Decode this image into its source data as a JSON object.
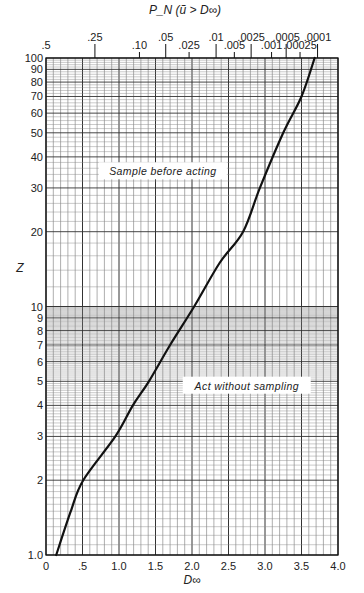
{
  "chart_data": {
    "type": "line",
    "title": "",
    "xlabel": "D∞",
    "ylabel": "Z",
    "top_axis_label": "P_N (ũ > D∞)",
    "xlim": [
      0,
      4.0
    ],
    "ylim": [
      1,
      100
    ],
    "yscale": "log",
    "grid": true,
    "x_ticks": [
      0,
      0.5,
      1.0,
      1.5,
      2.0,
      2.5,
      3.0,
      3.5,
      4.0
    ],
    "x_tick_labels": [
      "0",
      ".5",
      "1.0",
      "1.5",
      "2.0",
      "2.5",
      "3.0",
      "3.5",
      "4.0"
    ],
    "y_ticks": [
      1,
      2,
      3,
      4,
      5,
      6,
      7,
      8,
      9,
      10,
      20,
      30,
      40,
      50,
      60,
      70,
      80,
      90,
      100
    ],
    "y_tick_labels": [
      "1.0",
      "2",
      "3",
      "4",
      "5",
      "6",
      "7",
      "8",
      "9",
      "10",
      "20",
      "30",
      "40",
      "50",
      "60",
      "70",
      "80",
      "90",
      "100"
    ],
    "top_ticks": [
      {
        "label": ".5",
        "x": 0.0
      },
      {
        "label": ".25",
        "x": 0.67
      },
      {
        "label": ".10",
        "x": 1.28
      },
      {
        "label": ".05",
        "x": 1.64
      },
      {
        "label": ".025",
        "x": 1.96
      },
      {
        "label": ".01",
        "x": 2.33
      },
      {
        "label": ".005",
        "x": 2.58
      },
      {
        "label": ".0025",
        "x": 2.81
      },
      {
        "label": ".001",
        "x": 3.09
      },
      {
        "label": ".0005",
        "x": 3.29
      },
      {
        "label": ".00025",
        "x": 3.48
      },
      {
        "label": ".0001",
        "x": 3.72
      }
    ],
    "series": [
      {
        "name": "break-even curve",
        "x": [
          0.14,
          0.34,
          0.51,
          0.95,
          1.19,
          1.41,
          1.7,
          2.03,
          2.38,
          2.7,
          2.93,
          3.25,
          3.5,
          3.68
        ],
        "y": [
          1,
          1.5,
          2,
          3,
          4,
          5,
          7,
          10,
          15,
          20,
          30,
          50,
          70,
          100
        ]
      }
    ],
    "annotations": [
      {
        "text": "Sample before acting",
        "x": 1.6,
        "y": 35
      },
      {
        "text": "Act without sampling",
        "x": 2.75,
        "y": 4.8
      }
    ],
    "legend": null
  }
}
